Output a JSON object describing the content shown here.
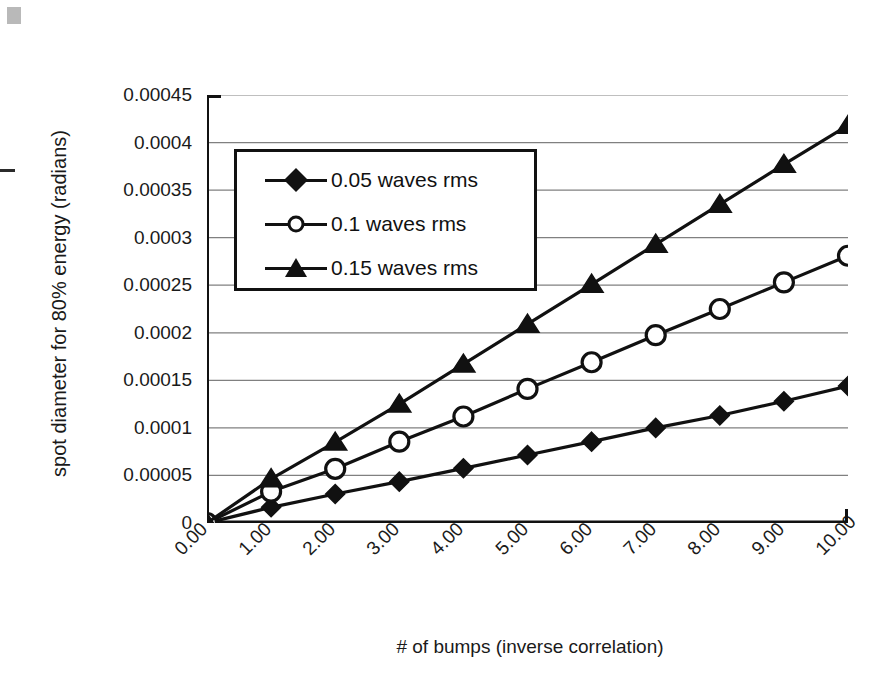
{
  "chart_data": {
    "type": "line",
    "title": "",
    "xlabel": "# of bumps (inverse correlation)",
    "ylabel": "spot diameter for 80% energy (radians)",
    "x": [
      0,
      1,
      2,
      3,
      4,
      5,
      6,
      7,
      8,
      9,
      10
    ],
    "xtick_labels": [
      "0.00",
      "1.00",
      "2.00",
      "3.00",
      "4.00",
      "5.00",
      "6.00",
      "7.00",
      "8.00",
      "9.00",
      "10.00"
    ],
    "ytick_labels": [
      "0",
      "0.00005",
      "0.0001",
      "0.00015",
      "0.0002",
      "0.00025",
      "0.0003",
      "0.00035",
      "0.0004",
      "0.00045"
    ],
    "ytick_values": [
      0,
      5e-05,
      0.0001,
      0.00015,
      0.0002,
      0.00025,
      0.0003,
      0.00035,
      0.0004,
      0.00045
    ],
    "xlim": [
      0,
      10
    ],
    "ylim": [
      0,
      0.00045
    ],
    "grid": "horizontal",
    "legend_position": "upper-left-inside",
    "line_color": "#111111",
    "series": [
      {
        "name": "0.05 waves rms",
        "marker": "filled-diamond",
        "values": [
          0,
          1.65e-05,
          3.05e-05,
          4.35e-05,
          5.75e-05,
          7.15e-05,
          8.55e-05,
          0.0001,
          0.000113,
          0.000128,
          0.000144
        ]
      },
      {
        "name": "0.1 waves rms",
        "marker": "open-circle",
        "values": [
          0,
          3.3e-05,
          5.7e-05,
          8.55e-05,
          0.000112,
          0.000141,
          0.000169,
          0.0001975,
          0.000225,
          0.000253,
          0.000281
        ]
      },
      {
        "name": "0.15 waves rms",
        "marker": "filled-triangle",
        "values": [
          0,
          4.65e-05,
          8.5e-05,
          0.000125,
          0.000167,
          0.000209,
          0.000251,
          0.000293,
          0.000335,
          0.000377,
          0.000418
        ]
      }
    ]
  }
}
